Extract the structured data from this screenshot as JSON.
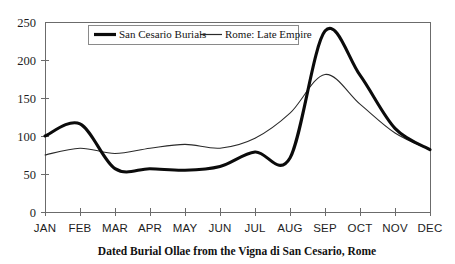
{
  "chart_data": {
    "type": "line",
    "title": "",
    "xlabel": "Dated Burial Ollae from the Vigna di San Cesario, Rome",
    "ylabel": "",
    "categories": [
      "JAN",
      "FEB",
      "MAR",
      "APR",
      "MAY",
      "JUN",
      "JUL",
      "AUG",
      "SEP",
      "OCT",
      "NOV",
      "DEC"
    ],
    "x_tick_labels": [
      "JAN",
      "FEB",
      "MAR",
      "APR",
      "MAY",
      "JUN",
      "JUL",
      "AUG",
      "SEP",
      "OCT",
      "NOV",
      "DEC"
    ],
    "y_tick_labels": [
      "0",
      "50",
      "100",
      "150",
      "200",
      "250"
    ],
    "y_ticks": [
      0,
      50,
      100,
      150,
      200,
      250
    ],
    "ylim": [
      0,
      250
    ],
    "grid": false,
    "legend_position": "top-center",
    "smoothing": "spline",
    "series": [
      {
        "name": "San Cesario Burials",
        "style": "thick",
        "color": "#0b0b0b",
        "values": [
          100,
          116,
          57,
          57,
          55,
          60,
          79,
          71,
          238,
          180,
          110,
          82
        ]
      },
      {
        "name": "Rome: Late Empire",
        "style": "thin",
        "color": "#2a2a2a",
        "values": [
          75,
          84,
          77,
          84,
          89,
          84,
          97,
          130,
          181,
          142,
          104,
          82
        ]
      }
    ]
  },
  "legend": {
    "entries": [
      {
        "label": "San Cesario Burials",
        "style": "thick"
      },
      {
        "label": "Rome: Late Empire",
        "style": "thin"
      }
    ]
  },
  "axes": {
    "x_title": "Dated Burial Ollae from the Vigna di San Cesario, Rome"
  }
}
